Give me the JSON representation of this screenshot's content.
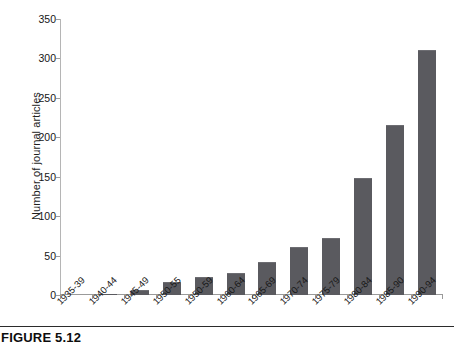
{
  "figure": {
    "caption": "FIGURE 5.12"
  },
  "chart_data": {
    "type": "bar",
    "title": "",
    "xlabel": "",
    "ylabel": "Number of journal articles",
    "categories": [
      "1935-39",
      "1940-44",
      "1945-49",
      "1950-55",
      "1950-59",
      "1960-64",
      "1965-69",
      "1970-74",
      "1975-79",
      "1980-84",
      "1985-90",
      "1990-94"
    ],
    "values": [
      0,
      1,
      5,
      15,
      22,
      27,
      40,
      60,
      71,
      147,
      214,
      310
    ],
    "ylim": [
      0,
      350
    ],
    "yticks": [
      0,
      50,
      100,
      150,
      200,
      250,
      300,
      350
    ],
    "ytick_labels": [
      "0",
      "50",
      "100",
      "150",
      "200",
      "250",
      "300",
      "350"
    ],
    "grid": false,
    "legend": false,
    "bar_color": "#5a5a5f",
    "axis_color": "#9a9a9a"
  }
}
